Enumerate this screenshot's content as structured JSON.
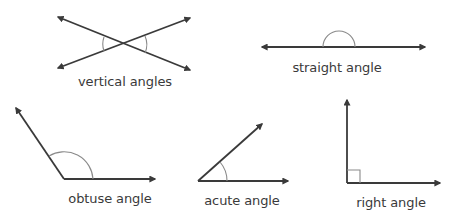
{
  "diagram": {
    "colors": {
      "line": "#3a3a3a",
      "arc": "#8a8a8a",
      "text": "#3a3a3a",
      "background": "#ffffff"
    },
    "figures": [
      {
        "id": "vertical",
        "label": "vertical angles"
      },
      {
        "id": "straight",
        "label": "straight angle"
      },
      {
        "id": "obtuse",
        "label": "obtuse angle"
      },
      {
        "id": "acute",
        "label": "acute angle"
      },
      {
        "id": "right",
        "label": "right angle"
      }
    ]
  }
}
